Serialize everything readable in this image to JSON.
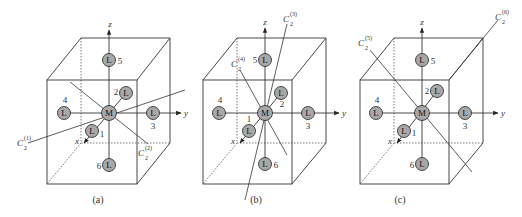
{
  "figure": {
    "panels": [
      {
        "caption": "(a)",
        "center_label": "M",
        "ligand_label": "L",
        "axes": {
          "x": "x",
          "y": "y",
          "z": "z"
        },
        "ligands": [
          "1",
          "2",
          "3",
          "4",
          "5",
          "6"
        ],
        "rotation_axes": [
          {
            "symbol": "C",
            "sub": "2",
            "sup": "(1)"
          },
          {
            "symbol": "C",
            "sub": "2",
            "sup": "(2)"
          }
        ]
      },
      {
        "caption": "(b)",
        "center_label": "M",
        "ligand_label": "L",
        "axes": {
          "x": "x",
          "y": "y",
          "z": "z"
        },
        "ligands": [
          "1",
          "2",
          "3",
          "4",
          "5",
          "6"
        ],
        "rotation_axes": [
          {
            "symbol": "C",
            "sub": "2",
            "sup": "(3)"
          },
          {
            "symbol": "C",
            "sub": "2",
            "sup": "(4)"
          }
        ]
      },
      {
        "caption": "(c)",
        "center_label": "M",
        "ligand_label": "L",
        "axes": {
          "x": "x",
          "y": "y",
          "z": "z"
        },
        "ligands": [
          "1",
          "2",
          "3",
          "4",
          "5",
          "6"
        ],
        "rotation_axes": [
          {
            "symbol": "C",
            "sub": "2",
            "sup": "(5)"
          },
          {
            "symbol": "C",
            "sub": "2",
            "sup": "(6)"
          }
        ]
      }
    ],
    "colors": {
      "ball_fill": "#a8a8a8",
      "line": "#333333",
      "background": "#ffffff"
    }
  }
}
